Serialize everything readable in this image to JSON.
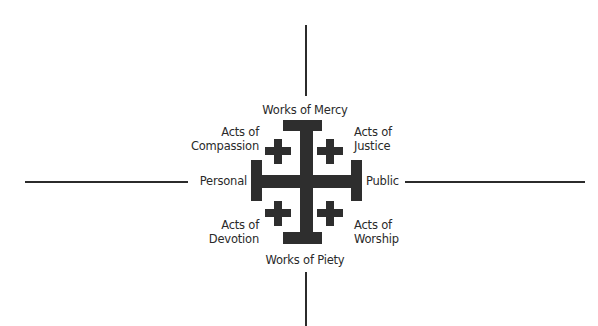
{
  "diagram": {
    "axes": {
      "left_label": "Personal",
      "right_label": "Public",
      "top_label": "Works of Mercy",
      "bottom_label": "Works of Piety"
    },
    "quadrants": {
      "top_left": {
        "line1": "Acts of",
        "line2": "Compassion"
      },
      "top_right": {
        "line1": "Acts of",
        "line2": "Justice"
      },
      "bottom_left": {
        "line1": "Acts of",
        "line2": "Devotion"
      },
      "bottom_right": {
        "line1": "Acts of",
        "line2": "Worship"
      }
    },
    "center_icon": "jerusalem-cross-icon",
    "colors": {
      "ink": "#2e2e2e",
      "text": "#2a2a2a",
      "background": "#ffffff"
    }
  }
}
